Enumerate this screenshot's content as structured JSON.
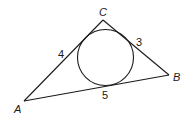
{
  "diagram": {
    "type": "triangle-with-incircle",
    "vertices": {
      "A": {
        "label": "A",
        "x": 24,
        "y": 101
      },
      "B": {
        "label": "B",
        "x": 169,
        "y": 75
      },
      "C": {
        "label": "C",
        "x": 103,
        "y": 20
      }
    },
    "incircle": {
      "cx": 105.5,
      "cy": 57.5,
      "r": 28
    },
    "segment_labels": {
      "AC_tangent_segment": "4",
      "CB_tangent_segment": "3",
      "AB_tangent_segment": "5"
    },
    "colors": {
      "stroke": "#1a1a1a",
      "background": "#ffffff"
    }
  }
}
